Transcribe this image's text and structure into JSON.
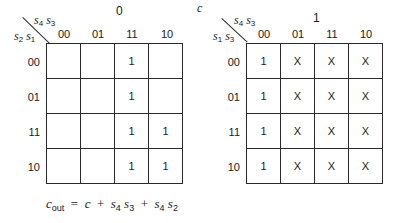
{
  "left_map": {
    "title": "0",
    "col_var_a": "s",
    "col_var_a_sub": "4",
    "col_var_b": "s",
    "col_var_b_sub": "3",
    "row_var_a": "s",
    "row_var_a_sub": "2",
    "row_var_b": "s",
    "row_var_b_sub": "1",
    "col_labels": [
      "00",
      "01",
      "11",
      "10"
    ],
    "row_labels": [
      "00",
      "01",
      "11",
      "10"
    ],
    "cells": [
      [
        "",
        "",
        "1",
        ""
      ],
      [
        "",
        "",
        "1",
        ""
      ],
      [
        "",
        "",
        "1",
        "1"
      ],
      [
        "",
        "",
        "1",
        "1"
      ]
    ]
  },
  "right_map": {
    "input_label": "c",
    "title": "1",
    "col_var_a": "s",
    "col_var_a_sub": "4",
    "col_var_b": "s",
    "col_var_b_sub": "3",
    "row_var_a": "s",
    "row_var_a_sub": "1",
    "row_var_b": "s",
    "row_var_b_sub": "3",
    "col_labels": [
      "00",
      "01",
      "11",
      "10"
    ],
    "row_labels": [
      "00",
      "01",
      "11",
      "10"
    ],
    "cells": [
      [
        "1",
        "X",
        "X",
        "X"
      ],
      [
        "1",
        "X",
        "X",
        "X"
      ],
      [
        "1",
        "X",
        "X",
        "X"
      ],
      [
        "1",
        "X",
        "X",
        "X"
      ]
    ]
  },
  "equation": {
    "lhs": "c",
    "lhs_sub": "out",
    "rhs": "= c + s₄ s₃ + s₄ s₂",
    "t1": "c",
    "t2a": "s",
    "t2a_sub": "4",
    "t2b": "s",
    "t2b_sub": "3",
    "t3a": "s",
    "t3a_sub": "4",
    "t3b": "s",
    "t3b_sub": "2"
  }
}
